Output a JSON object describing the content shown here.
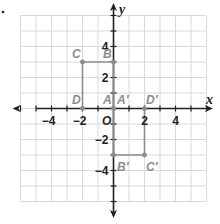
{
  "problem_marker": ".",
  "colors": {
    "grid": "#d9d9d9",
    "axis": "#231f20",
    "figure": "#8c8c8c",
    "text": "#231f20"
  },
  "axes": {
    "x_label": "x",
    "y_label": "y",
    "origin_label": "O",
    "x_range": [
      -6,
      6
    ],
    "y_range": [
      -6,
      6
    ],
    "x_tick_labels": [
      {
        "value": -4,
        "text": "−4"
      },
      {
        "value": -2,
        "text": "−2"
      },
      {
        "value": 2,
        "text": "2"
      },
      {
        "value": 4,
        "text": "4"
      }
    ],
    "y_tick_labels": [
      {
        "value": 4,
        "text": "4"
      },
      {
        "value": 2,
        "text": "2"
      },
      {
        "value": -2,
        "text": "−2"
      },
      {
        "value": -4,
        "text": "−4"
      }
    ]
  },
  "figures": {
    "original": {
      "name": "ABCD",
      "points": [
        {
          "label": "A",
          "x": 0,
          "y": 0
        },
        {
          "label": "B",
          "x": 0,
          "y": 3
        },
        {
          "label": "C",
          "x": -2,
          "y": 3
        },
        {
          "label": "D",
          "x": -2,
          "y": 0
        }
      ]
    },
    "image": {
      "name": "A'B'C'D'",
      "points": [
        {
          "label": "A′",
          "x": 0,
          "y": 0
        },
        {
          "label": "B′",
          "x": 0,
          "y": -3
        },
        {
          "label": "C′",
          "x": 2,
          "y": -3
        },
        {
          "label": "D′",
          "x": 2,
          "y": 0
        }
      ]
    }
  }
}
